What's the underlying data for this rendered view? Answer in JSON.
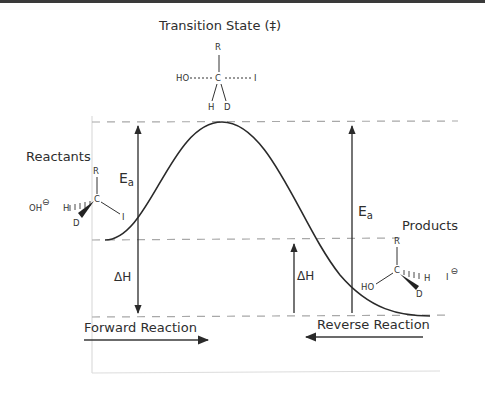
{
  "diagram": {
    "title": "Transition State (‡)",
    "labels": {
      "reactants": "Reactants",
      "products": "Products",
      "forward_reaction": "Forward Reaction",
      "reverse_reaction": "Reverse Reaction"
    },
    "energy_symbols": {
      "ea_main": "E",
      "ea_sub": "a",
      "delta_h": "ΔH"
    },
    "transition_state": {
      "top": "R",
      "left": "HO",
      "center": "C",
      "right": "I",
      "bottom_left": "H",
      "bottom_right": "D"
    },
    "reactant_molecule": {
      "nucleophile": "OH",
      "nucleophile_charge": "⊖",
      "top": "R",
      "center": "C",
      "left_hashed": "H",
      "left_wedge": "D",
      "leaving_group": "I"
    },
    "product_molecule": {
      "top": "R",
      "center": "C",
      "left": "HO",
      "right_hashed": "H",
      "bottom_wedge": "D",
      "leaving_ion": "I",
      "leaving_ion_charge": "⊖"
    },
    "colors": {
      "line": "#2a2a2a",
      "dash": "#a8a8a8",
      "axis": "#d8d8d8"
    }
  }
}
